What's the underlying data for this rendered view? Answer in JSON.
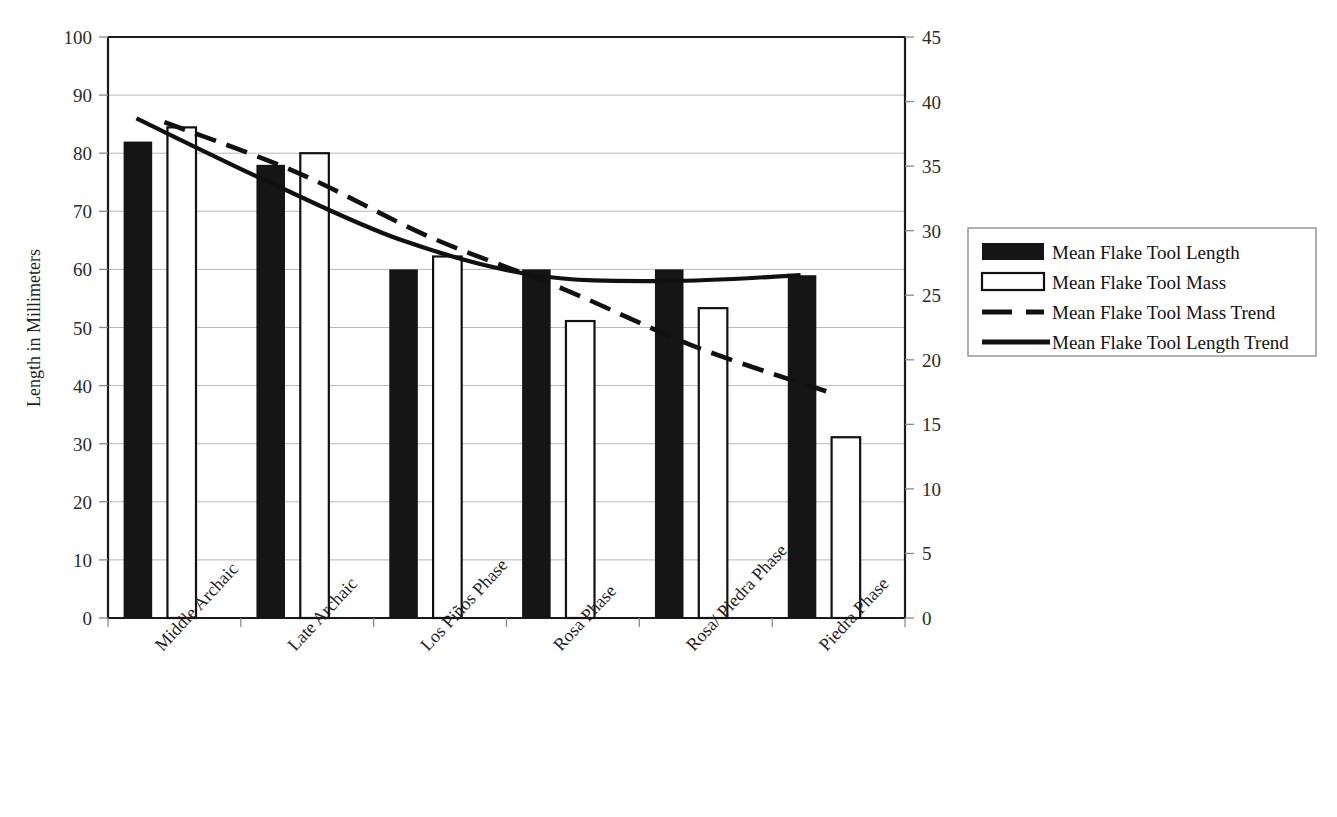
{
  "chart_data": {
    "type": "bar",
    "title": "",
    "subtitle": "",
    "xlabel": "",
    "ylabel": "Length in Millimeters",
    "y2label": "",
    "categories": [
      "Middle Archaic",
      "Late Archaic",
      "Los Piños Phase",
      "Rosa Phase",
      "Rosa/ Piedra Phase",
      "Piedra Phase"
    ],
    "ylim": [
      0,
      100
    ],
    "yticks": [
      0,
      10,
      20,
      30,
      40,
      50,
      60,
      70,
      80,
      90,
      100
    ],
    "y2lim": [
      0,
      45
    ],
    "y2ticks": [
      0,
      5,
      10,
      15,
      20,
      25,
      30,
      35,
      40,
      45
    ],
    "grid": true,
    "legend_position": "right",
    "series": [
      {
        "name": "Mean Flake Tool Length",
        "axis": "left",
        "style": "bar-filled",
        "color": "#151515",
        "values": [
          82,
          78,
          60,
          60,
          60,
          59
        ]
      },
      {
        "name": "Mean Flake Tool Mass",
        "axis": "right",
        "style": "bar-open",
        "color": "#ffffff",
        "values": [
          38,
          36,
          28,
          23,
          24,
          14
        ]
      },
      {
        "name": "Mean Flake Tool Mass Trend",
        "axis": "right",
        "style": "line-dashed",
        "color": "#111111",
        "values": [
          38.4,
          34.5,
          29.5,
          25.5,
          21.0,
          17.5
        ]
      },
      {
        "name": "Mean Flake Tool Length Trend",
        "axis": "left",
        "style": "line-solid",
        "color": "#111111",
        "values": [
          86,
          75,
          65,
          59,
          58,
          59
        ]
      }
    ],
    "legend_entries": [
      {
        "label": "Mean Flake Tool Length",
        "marker": "filled-rect"
      },
      {
        "label": "Mean Flake Tool Mass",
        "marker": "open-rect"
      },
      {
        "label": "Mean Flake Tool Mass Trend",
        "marker": "dashed-line"
      },
      {
        "label": "Mean Flake Tool Length Trend",
        "marker": "solid-line"
      }
    ]
  }
}
